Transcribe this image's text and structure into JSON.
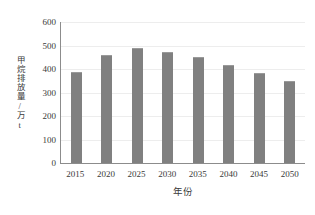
{
  "chart_data": {
    "type": "bar",
    "title": "",
    "xlabel": "年份",
    "ylabel": "甲烷排放量/万t",
    "categories": [
      "2015",
      "2020",
      "2025",
      "2030",
      "2035",
      "2040",
      "2045",
      "2050"
    ],
    "values": [
      385,
      455,
      485,
      468,
      445,
      412,
      378,
      345
    ],
    "ylim": [
      0,
      600
    ],
    "yticks": [
      0,
      100,
      200,
      300,
      400,
      500,
      600
    ],
    "ytick_labels": [
      "0",
      "100",
      "200",
      "300",
      "400",
      "500",
      "600"
    ],
    "grid": true,
    "grid_axis": "y",
    "legend": false,
    "bar_color": "#808080",
    "axis_color": "#8c8c8c",
    "grid_color": "#ededed",
    "background": "#ffffff"
  }
}
